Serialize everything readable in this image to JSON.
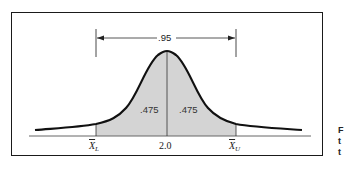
{
  "figure": {
    "interval_label": ".95",
    "left_area_label": ".475",
    "right_area_label": ".475",
    "lower_bound": {
      "symbol": "X",
      "subscript": "L"
    },
    "center_value": "2.0",
    "upper_bound": {
      "symbol": "X",
      "subscript": "U"
    }
  },
  "side_text": [
    "F",
    "t",
    "t"
  ],
  "colors": {
    "curve": "#111111",
    "shaded_area": "#d4d4d4",
    "frame": "#1a1a1a",
    "baseline": "#555555"
  }
}
